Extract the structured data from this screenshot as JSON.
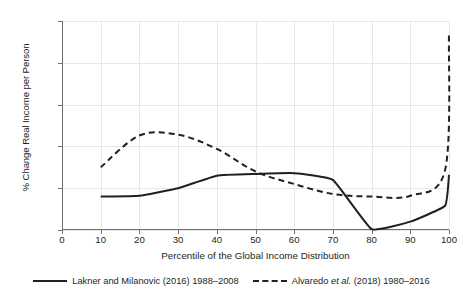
{
  "chart_data": {
    "type": "line",
    "title": "",
    "xlabel": "Percentile of the Global Income Distribution",
    "ylabel": "% Change Real Income per Person",
    "xlim": [
      0,
      100
    ],
    "ylim": [
      0,
      250
    ],
    "xticks": [
      0,
      10,
      20,
      30,
      40,
      50,
      60,
      70,
      80,
      90,
      100
    ],
    "yticks": [
      0,
      50,
      100,
      150,
      200,
      250
    ],
    "grid": true,
    "legend_position": "bottom",
    "series": [
      {
        "name": "Lakner and Milanovic (2016) 1988–2008",
        "style": "solid",
        "color": "#231f20",
        "x": [
          10,
          20,
          30,
          40,
          50,
          60,
          70,
          80,
          90,
          99,
          100
        ],
        "values": [
          40,
          41,
          50,
          65,
          67,
          68,
          60,
          1,
          10,
          29,
          66
        ]
      },
      {
        "name": "Alvaredo et al. (2018) 1980–2016",
        "style": "dashed",
        "color": "#231f20",
        "x": [
          10,
          20,
          30,
          40,
          50,
          60,
          70,
          80,
          90,
          99,
          100
        ],
        "values": [
          75,
          113,
          114,
          97,
          70,
          55,
          43,
          40,
          41,
          72,
          235
        ]
      }
    ]
  },
  "legend": {
    "entries": [
      {
        "prefix": "Lakner and Milanovic (2016) 1988–2008",
        "italic": "",
        "suffix": ""
      },
      {
        "prefix": "Alvaredo ",
        "italic": "et al.",
        "suffix": " (2018) 1980–2016"
      }
    ]
  }
}
